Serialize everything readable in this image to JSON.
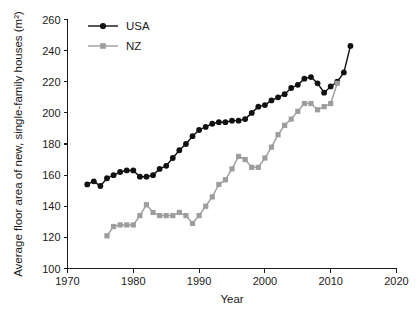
{
  "chart_data": {
    "type": "line",
    "title": "",
    "xlabel": "Year",
    "ylabel": "Average floor area of new, single-family houses (m²)",
    "xlim": [
      1970,
      2020
    ],
    "ylim": [
      100,
      260
    ],
    "xticks": [
      1970,
      1980,
      1990,
      2000,
      2010,
      2020
    ],
    "yticks": [
      100,
      120,
      140,
      160,
      180,
      200,
      220,
      240,
      260
    ],
    "grid": false,
    "legend_position": "top-left",
    "series": [
      {
        "name": "USA",
        "color": "#111111",
        "marker": "circle",
        "x": [
          1973,
          1974,
          1975,
          1976,
          1977,
          1978,
          1979,
          1980,
          1981,
          1982,
          1983,
          1984,
          1985,
          1986,
          1987,
          1988,
          1989,
          1990,
          1991,
          1992,
          1993,
          1994,
          1995,
          1996,
          1997,
          1998,
          1999,
          2000,
          2001,
          2002,
          2003,
          2004,
          2005,
          2006,
          2007,
          2008,
          2009,
          2010,
          2011,
          2012,
          2013
        ],
        "values": [
          154,
          156,
          153,
          158,
          160,
          162,
          163,
          163,
          159,
          159,
          160,
          164,
          166,
          171,
          176,
          180,
          185,
          189,
          191,
          193,
          194,
          194,
          195,
          195,
          196,
          200,
          204,
          205,
          208,
          210,
          212,
          216,
          218,
          222,
          223,
          219,
          213,
          217,
          220,
          226,
          243
        ]
      },
      {
        "name": "NZ",
        "color": "#9d9d9d",
        "marker": "square",
        "x": [
          1976,
          1977,
          1978,
          1979,
          1980,
          1981,
          1982,
          1983,
          1984,
          1985,
          1986,
          1987,
          1988,
          1989,
          1990,
          1991,
          1992,
          1993,
          1994,
          1995,
          1996,
          1997,
          1998,
          1999,
          2000,
          2001,
          2002,
          2003,
          2004,
          2005,
          2006,
          2007,
          2008,
          2009,
          2010,
          2011
        ],
        "values": [
          121,
          127,
          128,
          128,
          128,
          134,
          141,
          136,
          134,
          134,
          134,
          136,
          134,
          129,
          134,
          140,
          146,
          154,
          157,
          164,
          172,
          170,
          165,
          165,
          171,
          178,
          186,
          192,
          196,
          201,
          206,
          206,
          202,
          204,
          206,
          219
        ]
      }
    ]
  },
  "legend": {
    "entries": [
      {
        "label": "USA"
      },
      {
        "label": "NZ"
      }
    ]
  }
}
